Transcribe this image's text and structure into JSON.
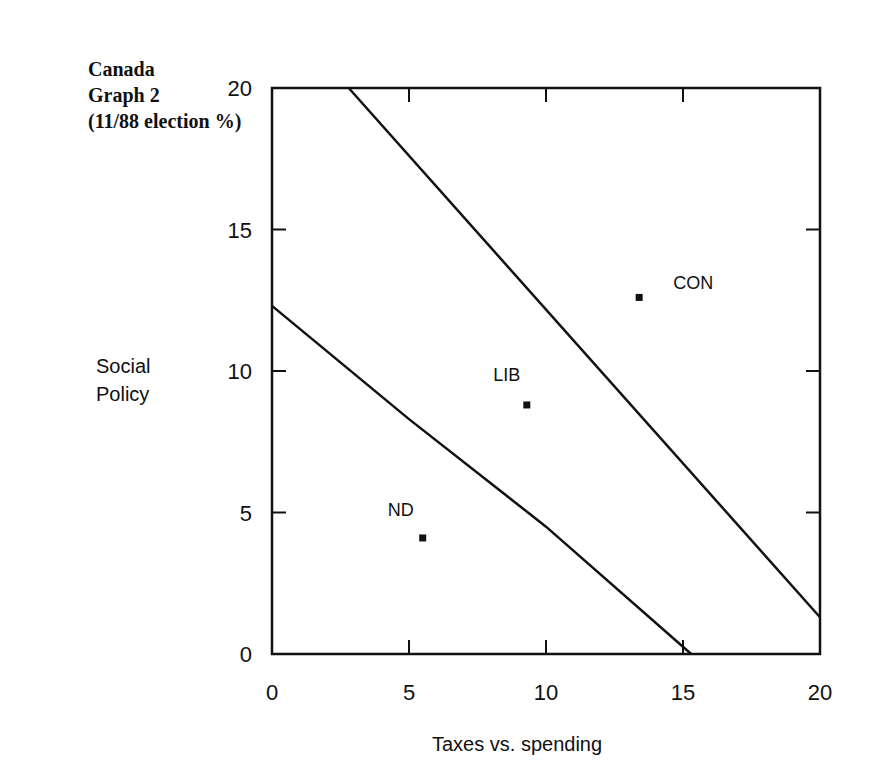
{
  "title": {
    "line1": "Canada",
    "line2": "Graph 2",
    "line3": "(11/88 election %)"
  },
  "axes": {
    "xlabel": "Taxes vs. spending",
    "ylabel_line1": "Social",
    "ylabel_line2": "Policy",
    "xticks": [
      "0",
      "5",
      "10",
      "15",
      "20"
    ],
    "yticks": [
      "0",
      "5",
      "10",
      "15",
      "20"
    ]
  },
  "chart_data": {
    "type": "scatter",
    "title": "Canada Graph 2 (11/88 election %)",
    "xlabel": "Taxes vs. spending",
    "ylabel": "Social Policy",
    "xlim": [
      0,
      20
    ],
    "ylim": [
      0,
      20
    ],
    "grid": false,
    "legend": "none",
    "points": [
      {
        "label": "CON",
        "x": 13.4,
        "y": 12.6
      },
      {
        "label": "LIB",
        "x": 9.3,
        "y": 8.8
      },
      {
        "label": "ND",
        "x": 5.5,
        "y": 4.1
      }
    ],
    "lines": [
      {
        "name": "upper boundary",
        "x": [
          2.8,
          20
        ],
        "y": [
          20,
          1.3
        ]
      },
      {
        "name": "lower boundary",
        "x": [
          0,
          5,
          10,
          15.3
        ],
        "y": [
          12.3,
          8.3,
          4.5,
          0
        ]
      }
    ]
  }
}
